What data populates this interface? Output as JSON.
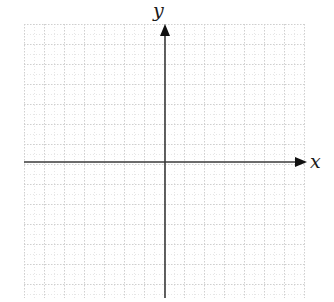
{
  "diagram": {
    "type": "coordinate-plane",
    "axes": {
      "x_label": "x",
      "y_label": "y",
      "axis_color": "#3a3a3a",
      "x_axis_y": 162,
      "y_axis_x": 165,
      "x_axis_start": 24,
      "x_axis_end": 307,
      "y_axis_start": 24,
      "y_axis_end": 298
    },
    "grid": {
      "left": 24,
      "top": 24,
      "right": 306,
      "bottom": 298,
      "minor_spacing": 10,
      "major_spacing": 20,
      "minor_color": "#e6e6e6",
      "major_color": "#cfcfcf",
      "style": "dotted"
    }
  }
}
